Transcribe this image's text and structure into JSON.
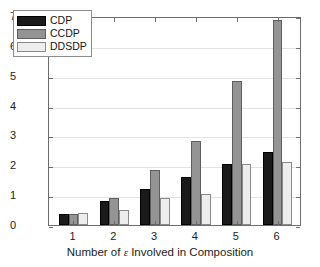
{
  "figure": {
    "background": "#ffffff",
    "frame_color": "#6d6d6d",
    "grid_color": "#e2e2e2"
  },
  "chart_data": {
    "type": "bar",
    "title": "",
    "subtitle": "",
    "xlabel": "Number of ϵ Involved in Composition",
    "ylabel": "Privacy Level(ϵ)",
    "categories": [
      "1",
      "2",
      "3",
      "4",
      "5",
      "6"
    ],
    "series": [
      {
        "name": "CDP",
        "color": "#1a1a1a",
        "values": [
          0.38,
          0.8,
          1.22,
          1.62,
          2.05,
          2.44
        ]
      },
      {
        "name": "CCDP",
        "color": "#949494",
        "values": [
          0.38,
          0.91,
          1.83,
          2.83,
          4.84,
          6.88
        ]
      },
      {
        "name": "DDSDP",
        "color": "#ededed",
        "values": [
          0.39,
          0.5,
          0.92,
          1.05,
          2.05,
          2.11
        ]
      }
    ],
    "xlim": [
      0.4,
      6.6
    ],
    "ylim": [
      0,
      7
    ],
    "yticks": [
      0,
      1,
      2,
      3,
      4,
      5,
      6,
      7
    ],
    "ytick_labels": [
      "0",
      "1",
      "2",
      "3",
      "4",
      "5",
      "6",
      "7"
    ],
    "xticks": [
      1,
      2,
      3,
      4,
      5,
      6
    ],
    "xtick_labels": [
      "1",
      "2",
      "3",
      "4",
      "5",
      "6"
    ],
    "grid": true,
    "legend_position": "upper left",
    "legend_entries": [
      "CDP",
      "CCDP",
      "DDSDP"
    ]
  }
}
